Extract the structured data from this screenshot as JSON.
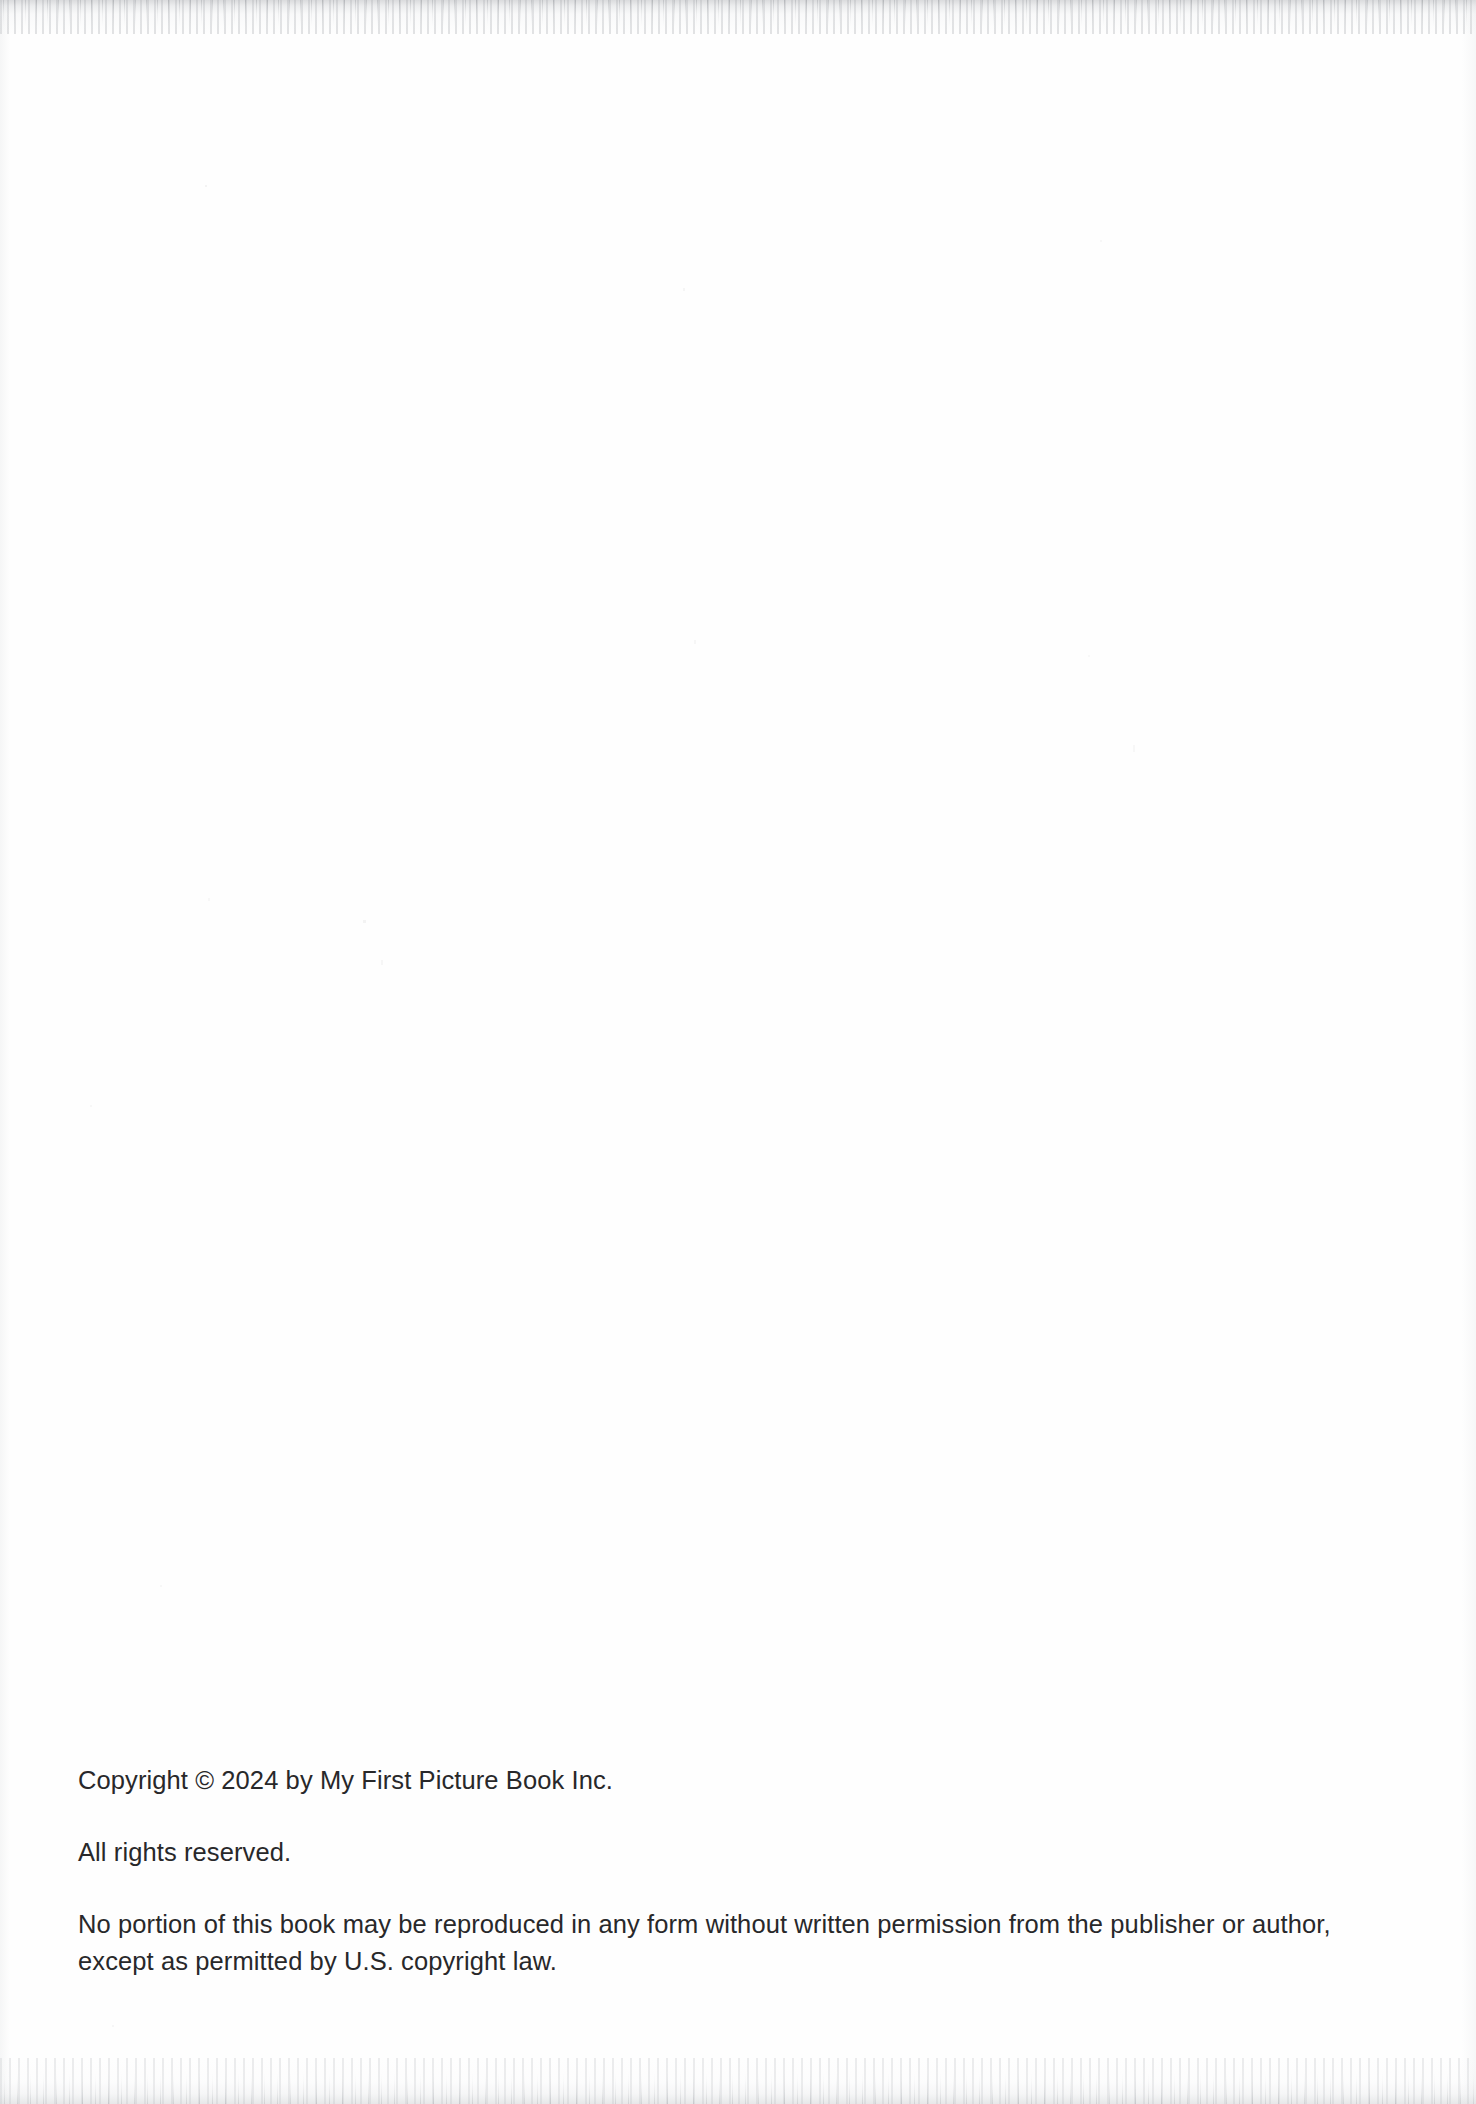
{
  "page": {
    "type": "book-copyright-page",
    "background_color": "#fefefe",
    "text_color": "#28282a"
  },
  "copyright": {
    "line_copyright": "Copyright © 2024 by My First Picture Book Inc.",
    "line_rights_reserved": "All rights reserved.",
    "line_reproduction_notice": "No portion of this book may be reproduced in any form without written permission from the publisher or author, except as permitted by U.S. copyright law."
  },
  "publisher": {
    "name": "My First Picture Book Inc.",
    "year": "2024"
  }
}
